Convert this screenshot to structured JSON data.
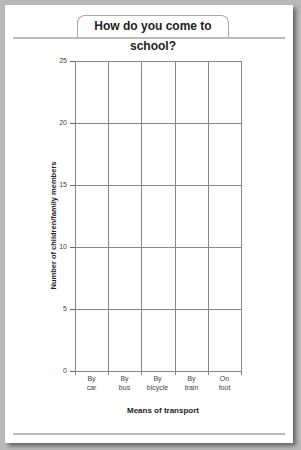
{
  "chart_data": {
    "type": "bar",
    "title": "How do you come to school?",
    "xlabel": "Means of transport",
    "ylabel": "Number of children/family members",
    "categories": [
      "By car",
      "By bus",
      "By bicycle",
      "By train",
      "On foot"
    ],
    "category_lines": [
      [
        "By",
        "car"
      ],
      [
        "By",
        "bus"
      ],
      [
        "By",
        "bicycle"
      ],
      [
        "By",
        "train"
      ],
      [
        "On",
        "foot"
      ]
    ],
    "values": [
      null,
      null,
      null,
      null,
      null
    ],
    "ylim": [
      0,
      25
    ],
    "yticks": [
      0,
      5,
      10,
      15,
      20,
      25
    ],
    "grid": true,
    "legend": null,
    "note": "Blank template chart - no bars drawn"
  }
}
